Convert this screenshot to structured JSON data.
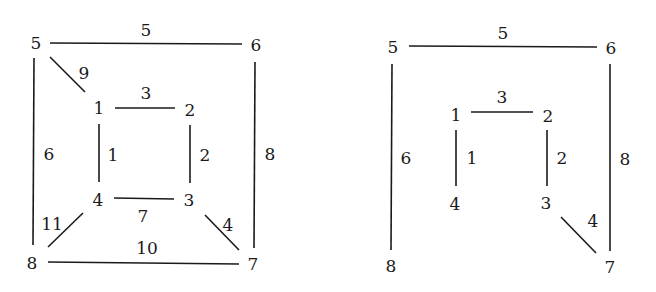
{
  "colors": {
    "stroke": "#1a1a1a",
    "text": "#1a1a1a",
    "background": "#ffffff"
  },
  "graphs": [
    {
      "name": "full-graph",
      "nodes": [
        {
          "id": "1",
          "x": 99,
          "y": 108
        },
        {
          "id": "2",
          "x": 190,
          "y": 110
        },
        {
          "id": "3",
          "x": 189,
          "y": 200
        },
        {
          "id": "4",
          "x": 98,
          "y": 200
        },
        {
          "id": "5",
          "x": 36,
          "y": 43
        },
        {
          "id": "6",
          "x": 256,
          "y": 45
        },
        {
          "id": "7",
          "x": 253,
          "y": 264
        },
        {
          "id": "8",
          "x": 32,
          "y": 263
        }
      ],
      "edges": [
        {
          "from": "5",
          "to": "6",
          "weight": "5",
          "x1": 50,
          "y1": 43,
          "x2": 242,
          "y2": 44,
          "lx": 146,
          "ly": 30
        },
        {
          "from": "5",
          "to": "1",
          "weight": "9",
          "x1": 50,
          "y1": 57,
          "x2": 85,
          "y2": 92,
          "lx": 84,
          "ly": 73
        },
        {
          "from": "1",
          "to": "2",
          "weight": "3",
          "x1": 115,
          "y1": 108,
          "x2": 175,
          "y2": 108,
          "lx": 146,
          "ly": 93
        },
        {
          "from": "1",
          "to": "4",
          "weight": "1",
          "x1": 99,
          "y1": 124,
          "x2": 99,
          "y2": 182,
          "lx": 113,
          "ly": 155
        },
        {
          "from": "2",
          "to": "3",
          "weight": "2",
          "x1": 190,
          "y1": 125,
          "x2": 190,
          "y2": 183,
          "lx": 205,
          "ly": 155
        },
        {
          "from": "4",
          "to": "3",
          "weight": "7",
          "x1": 114,
          "y1": 198,
          "x2": 174,
          "y2": 199,
          "lx": 143,
          "ly": 216
        },
        {
          "from": "8",
          "to": "4",
          "weight": "11",
          "x1": 48,
          "y1": 247,
          "x2": 83,
          "y2": 213,
          "lx": 52,
          "ly": 224
        },
        {
          "from": "3",
          "to": "7",
          "weight": "4",
          "x1": 205,
          "y1": 215,
          "x2": 239,
          "y2": 250,
          "lx": 228,
          "ly": 225
        },
        {
          "from": "8",
          "to": "7",
          "weight": "10",
          "x1": 48,
          "y1": 262,
          "x2": 239,
          "y2": 264,
          "lx": 147,
          "ly": 248
        },
        {
          "from": "5",
          "to": "8",
          "weight": "6",
          "x1": 34,
          "y1": 58,
          "x2": 33,
          "y2": 245,
          "lx": 49,
          "ly": 154
        },
        {
          "from": "6",
          "to": "7",
          "weight": "8",
          "x1": 255,
          "y1": 62,
          "x2": 254,
          "y2": 248,
          "lx": 270,
          "ly": 154
        }
      ]
    },
    {
      "name": "spanning-tree",
      "nodes": [
        {
          "id": "1",
          "x": 456,
          "y": 115
        },
        {
          "id": "2",
          "x": 548,
          "y": 116
        },
        {
          "id": "3",
          "x": 546,
          "y": 203
        },
        {
          "id": "4",
          "x": 455,
          "y": 204
        },
        {
          "id": "5",
          "x": 393,
          "y": 47
        },
        {
          "id": "6",
          "x": 611,
          "y": 48
        },
        {
          "id": "7",
          "x": 610,
          "y": 267
        },
        {
          "id": "8",
          "x": 391,
          "y": 266
        }
      ],
      "edges": [
        {
          "from": "5",
          "to": "6",
          "weight": "5",
          "x1": 409,
          "y1": 46,
          "x2": 597,
          "y2": 47,
          "lx": 503,
          "ly": 33
        },
        {
          "from": "1",
          "to": "2",
          "weight": "3",
          "x1": 471,
          "y1": 112,
          "x2": 533,
          "y2": 112,
          "lx": 502,
          "ly": 97
        },
        {
          "from": "1",
          "to": "4",
          "weight": "1",
          "x1": 456,
          "y1": 130,
          "x2": 456,
          "y2": 186,
          "lx": 472,
          "ly": 158
        },
        {
          "from": "2",
          "to": "3",
          "weight": "2",
          "x1": 547,
          "y1": 130,
          "x2": 547,
          "y2": 186,
          "lx": 562,
          "ly": 158
        },
        {
          "from": "3",
          "to": "7",
          "weight": "4",
          "x1": 561,
          "y1": 217,
          "x2": 596,
          "y2": 253,
          "lx": 593,
          "ly": 221
        },
        {
          "from": "5",
          "to": "8",
          "weight": "6",
          "x1": 392,
          "y1": 64,
          "x2": 391,
          "y2": 250,
          "lx": 406,
          "ly": 158
        },
        {
          "from": "6",
          "to": "7",
          "weight": "8",
          "x1": 610,
          "y1": 64,
          "x2": 610,
          "y2": 251,
          "lx": 625,
          "ly": 159
        }
      ]
    }
  ]
}
